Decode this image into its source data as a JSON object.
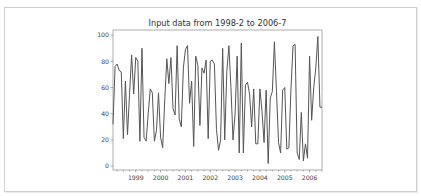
{
  "chart_data": {
    "type": "line",
    "title": "Input data from 1998-2 to 2006-7",
    "xlabel": "",
    "ylabel": "",
    "ylim": [
      -3,
      104
    ],
    "xlim": [
      "1998-02",
      "2006-07"
    ],
    "grid": false,
    "legend": null,
    "x_tick_labels": [
      "1999",
      "2000",
      "2001",
      "2002",
      "2003",
      "2004",
      "2005",
      "2006"
    ],
    "y_tick_labels": [
      "0",
      "20",
      "40",
      "60",
      "80",
      "100"
    ],
    "y_ticks": [
      0,
      20,
      40,
      60,
      80,
      100
    ],
    "line_color": "#555555",
    "x_start": "1998-02",
    "frequency": "monthly",
    "values": [
      32,
      76,
      78,
      73,
      72,
      21,
      65,
      24,
      55,
      85,
      55,
      83,
      80,
      19,
      90,
      22,
      19,
      40,
      59,
      56,
      19,
      27,
      56,
      22,
      14,
      50,
      82,
      63,
      83,
      44,
      39,
      92,
      36,
      30,
      75,
      89,
      92,
      48,
      65,
      15,
      84,
      77,
      31,
      75,
      71,
      81,
      21,
      80,
      81,
      78,
      28,
      12,
      20,
      90,
      20,
      72,
      92,
      60,
      20,
      40,
      84,
      10,
      94,
      10,
      62,
      64,
      55,
      30,
      59,
      17,
      17,
      59,
      42,
      18,
      58,
      2,
      52,
      57,
      95,
      57,
      18,
      10,
      58,
      60,
      13,
      14,
      59,
      92,
      93,
      10,
      5,
      41,
      4,
      17,
      6,
      84,
      35,
      60,
      75,
      99,
      45,
      45
    ]
  },
  "axes_px": {
    "left": 113,
    "right": 322,
    "top": 30,
    "bottom": 170
  }
}
